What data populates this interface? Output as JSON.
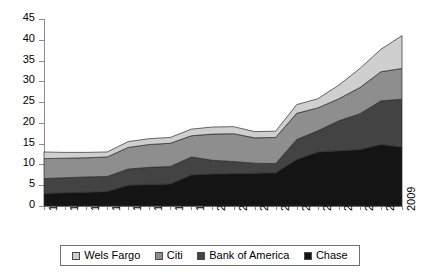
{
  "chart_data": {
    "type": "area",
    "stacked": true,
    "title": "",
    "xlabel": "",
    "ylabel": "",
    "grid": false,
    "legend_position": "bottom",
    "categories": [
      "1992",
      "1993",
      "1994",
      "1995",
      "1996",
      "1997",
      "1998",
      "1999",
      "2000",
      "2001",
      "2002",
      "2003",
      "2004",
      "2005",
      "2006",
      "2007",
      "2008",
      "2009"
    ],
    "xlim": [
      1992,
      2009
    ],
    "ylim": [
      0,
      45
    ],
    "ytick_labels": [
      "0",
      "5",
      "10",
      "15",
      "20",
      "25",
      "30",
      "35",
      "40",
      "45"
    ],
    "ytick_values": [
      0,
      5,
      10,
      15,
      20,
      25,
      30,
      35,
      40,
      45
    ],
    "series": [
      {
        "name": "Chase",
        "color": "#141414",
        "stack_order": 1,
        "values": [
          3.0,
          3.2,
          3.3,
          3.5,
          5.0,
          5.2,
          5.3,
          7.5,
          7.7,
          7.8,
          7.9,
          8.0,
          11.2,
          13.0,
          13.3,
          13.6,
          14.8,
          14.2
        ]
      },
      {
        "name": "Bank of America",
        "color": "#434343",
        "stack_order": 2,
        "values": [
          3.6,
          3.6,
          3.7,
          3.6,
          3.9,
          4.1,
          4.2,
          4.3,
          3.3,
          2.9,
          2.4,
          2.2,
          4.8,
          5.1,
          7.2,
          8.6,
          10.5,
          11.5
        ]
      },
      {
        "name": "Citi",
        "color": "#8e8e8e",
        "stack_order": 3,
        "values": [
          4.8,
          4.7,
          4.6,
          4.7,
          5.2,
          5.5,
          5.6,
          5.1,
          6.3,
          6.7,
          6.1,
          6.3,
          6.3,
          5.5,
          5.3,
          6.3,
          7.0,
          7.4
        ]
      },
      {
        "name": "Wels Fargo",
        "color": "#cfcfcf",
        "stack_order": 4,
        "values": [
          1.6,
          1.4,
          1.3,
          1.2,
          1.4,
          1.4,
          1.4,
          1.6,
          1.7,
          1.7,
          1.5,
          1.5,
          2.1,
          2.2,
          3.3,
          4.6,
          5.4,
          7.9
        ]
      }
    ],
    "totals": [
      13.0,
      12.9,
      12.9,
      13.0,
      15.5,
      16.2,
      16.5,
      18.5,
      19.0,
      19.1,
      17.9,
      18.0,
      24.4,
      25.8,
      29.1,
      33.1,
      37.7,
      41.0
    ]
  },
  "legend": {
    "items": [
      {
        "label": "Wels Fargo",
        "swatch_name": "legend-swatch-wels-fargo",
        "color": "#cfcfcf"
      },
      {
        "label": "Citi",
        "swatch_name": "legend-swatch-citi",
        "color": "#8e8e8e"
      },
      {
        "label": "Bank of America",
        "swatch_name": "legend-swatch-bank-of-america",
        "color": "#434343"
      },
      {
        "label": "Chase",
        "swatch_name": "legend-swatch-chase",
        "color": "#141414"
      }
    ]
  }
}
